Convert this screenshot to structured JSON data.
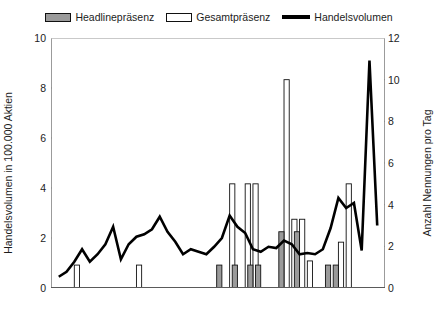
{
  "legend": {
    "items": [
      {
        "label": "Headlinepräsenz",
        "marker": "gray-square-swatch",
        "color": "#9a9a9a"
      },
      {
        "label": "Gesamtpräsenz",
        "marker": "white-square-swatch",
        "color": "#ffffff"
      },
      {
        "label": "Handelsvolumen",
        "marker": "black-line-swatch",
        "color": "#000000"
      }
    ]
  },
  "axes": {
    "left_title": "Handelsvolumen in 100.000 Aktien",
    "right_title": "Anzahl Nennungen pro Tag",
    "left_ticks": [
      "0",
      "2",
      "4",
      "6",
      "8",
      "10"
    ],
    "right_ticks": [
      "0",
      "2",
      "4",
      "6",
      "8",
      "10",
      "12"
    ]
  },
  "chart_data": {
    "type": "bar",
    "title": "",
    "xlabel": "",
    "ylabel": "Handelsvolumen in 100.000 Aktien",
    "y2label": "Anzahl Nennungen pro Tag",
    "ylim": [
      0,
      10
    ],
    "y2lim": [
      0,
      12
    ],
    "grid": false,
    "legend_position": "top-center",
    "x": [
      1,
      2,
      3,
      4,
      5,
      6,
      7,
      8,
      9,
      10,
      11,
      12,
      13,
      14,
      15,
      16,
      17,
      18,
      19,
      20,
      21,
      22,
      23,
      24,
      25,
      26,
      27,
      28,
      29,
      30,
      31,
      32,
      33,
      34,
      35,
      36,
      37,
      38,
      39,
      40,
      41,
      42
    ],
    "series": [
      {
        "name": "Headlinepräsenz",
        "type": "bar",
        "axis": "right",
        "color": "#9a9a9a",
        "values": [
          0,
          0,
          0,
          0,
          0,
          0,
          0,
          0,
          0,
          0,
          0,
          0,
          0,
          0,
          0,
          0,
          0,
          0,
          0,
          0,
          0,
          1.1,
          0,
          1.1,
          0,
          1.1,
          1.1,
          0,
          0,
          2.7,
          0,
          2.7,
          0,
          0,
          0,
          1.1,
          1.1,
          0,
          0,
          0,
          0,
          0
        ]
      },
      {
        "name": "Gesamtpräsenz",
        "type": "bar",
        "axis": "right",
        "color": "#ffffff",
        "values": [
          0,
          0,
          1.1,
          0,
          0,
          0,
          0,
          0,
          0,
          0,
          1.1,
          0,
          0,
          0,
          0,
          0,
          0,
          0,
          0,
          0,
          0,
          0,
          5.0,
          0,
          5.0,
          5.0,
          0,
          0,
          0,
          10.0,
          3.3,
          3.3,
          1.3,
          0,
          0,
          0,
          2.2,
          5.0,
          0,
          0,
          0,
          0
        ]
      },
      {
        "name": "Handelsvolumen",
        "type": "line",
        "axis": "left",
        "color": "#000000",
        "values": [
          0.45,
          0.65,
          1.05,
          1.55,
          1.05,
          1.35,
          1.75,
          2.45,
          1.15,
          1.75,
          2.05,
          2.15,
          2.35,
          2.85,
          2.25,
          1.85,
          1.35,
          1.55,
          1.45,
          1.35,
          1.65,
          2.0,
          2.9,
          2.45,
          2.2,
          1.55,
          1.45,
          1.65,
          1.6,
          1.9,
          1.75,
          1.35,
          1.4,
          1.35,
          1.55,
          2.4,
          3.6,
          3.2,
          3.4,
          1.5,
          9.1,
          2.5
        ]
      }
    ]
  }
}
